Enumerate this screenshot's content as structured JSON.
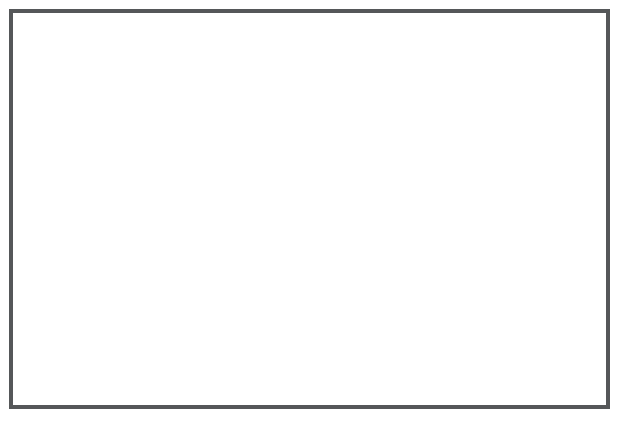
{
  "chart_data": {
    "type": "line",
    "title": "",
    "xlabel": "Tests",
    "ylabel": "Scores for Willy",
    "categories": [
      "Test 1",
      "Test 2",
      "Test 3",
      "Test 4",
      "Test 5",
      "Test 6",
      "Test 7",
      "Test 8",
      "Test 9",
      "Test 10",
      "Test 11",
      "Test 12",
      "Test 13",
      "Test 14",
      "Test 15",
      "Test 16",
      "Test 17",
      "Test 18",
      "Test 19",
      "Test 20",
      "Test 21",
      "Test 22",
      "Test 23"
    ],
    "values": [
      1,
      2,
      4,
      1,
      2,
      3,
      3,
      2,
      3,
      2,
      4,
      3,
      2,
      4,
      4,
      3,
      3,
      4,
      3,
      5,
      4,
      5,
      5
    ],
    "ylim": [
      0,
      5
    ],
    "ytick_labels": [
      "0",
      "1",
      "2",
      "3",
      "4",
      "5"
    ],
    "ytick_values": [
      0,
      1,
      2,
      3,
      4,
      5
    ],
    "grid": false,
    "legend": false,
    "marker": "filled-circle",
    "marker_color": "#111111",
    "line_color": "#8d8d8d",
    "axis_color": "#8a8a8a",
    "frame_color": "#555759",
    "background_color": "#ffffff"
  }
}
